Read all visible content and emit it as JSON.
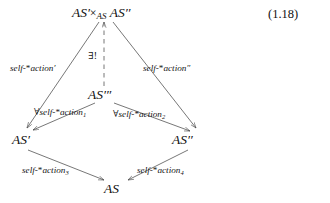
{
  "figure": {
    "equation_number": "(1.18)",
    "type": "commutative-diagram",
    "stroke_color": "#4a4a4a",
    "text_color": "#111111"
  },
  "nodes": {
    "top": {
      "id": "pullback",
      "label_left": "AS",
      "label_left_prime": "′",
      "times": "×",
      "subscript": "AS",
      "label_right": "AS",
      "label_right_prime": "′′",
      "full_text": "AS′ ×AS AS′′"
    },
    "middle": {
      "id": "as-triple-prime",
      "base": "AS",
      "primes": "′′′",
      "full_text": "AS′′′"
    },
    "left": {
      "id": "as-prime",
      "base": "AS",
      "primes": "′",
      "full_text": "AS′"
    },
    "right": {
      "id": "as-double-prime",
      "base": "AS",
      "primes": "′′",
      "full_text": "AS′′"
    },
    "bottom": {
      "id": "as",
      "base": "AS",
      "primes": "",
      "full_text": "AS"
    }
  },
  "edges": [
    {
      "id": "pullback-to-left",
      "from": "pullback",
      "to": "as-prime",
      "style": "solid",
      "label_base": "self-",
      "label_star": "*",
      "label_word": "action",
      "label_sup": "′",
      "label_full": "self-*action′"
    },
    {
      "id": "pullback-to-right",
      "from": "pullback",
      "to": "as-double-prime",
      "style": "solid",
      "label_base": "self-",
      "label_star": "*",
      "label_word": "action",
      "label_sup": "′′",
      "label_full": "self-*action′′"
    },
    {
      "id": "triple-to-pullback",
      "from": "as-triple-prime",
      "to": "pullback",
      "style": "dashed",
      "label_full": "∃!"
    },
    {
      "id": "triple-to-left",
      "from": "as-triple-prime",
      "to": "as-prime",
      "style": "solid",
      "label_quant": "∀",
      "label_base": "self-",
      "label_star": "*",
      "label_word": "action",
      "label_sub": "1",
      "label_full": "∀self-*action₁"
    },
    {
      "id": "triple-to-right",
      "from": "as-triple-prime",
      "to": "as-double-prime",
      "style": "solid",
      "label_quant": "∀",
      "label_base": "self-",
      "label_star": "*",
      "label_word": "action",
      "label_sub": "2",
      "label_full": "∀self-*action₂"
    },
    {
      "id": "left-to-bottom",
      "from": "as-prime",
      "to": "as",
      "style": "solid",
      "label_base": "self-",
      "label_star": "*",
      "label_word": "action",
      "label_sub": "3",
      "label_full": "self-*action₃"
    },
    {
      "id": "right-to-bottom",
      "from": "as-double-prime",
      "to": "as",
      "style": "solid",
      "label_base": "self-",
      "label_star": "*",
      "label_word": "action",
      "label_sub": "4",
      "label_full": "self-*action₄"
    }
  ]
}
